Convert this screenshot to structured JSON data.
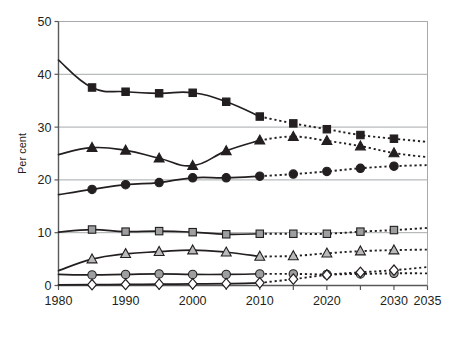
{
  "chart_data": {
    "type": "line",
    "title": "",
    "subtitle": "",
    "xlabel": "",
    "ylabel": "Per cent",
    "xlim": [
      1980,
      2035
    ],
    "ylim": [
      0,
      50
    ],
    "grid": true,
    "grid_axis": "y",
    "legend_position": "bottom",
    "x_tick_labels": [
      "1980",
      "1990",
      "2000",
      "2010",
      "2020",
      "2030",
      "2035"
    ],
    "x_tick_values": [
      1980,
      1990,
      2000,
      2010,
      2020,
      2030,
      2035
    ],
    "x_minor_tick_values": [
      1985,
      1995,
      2005,
      2015,
      2025
    ],
    "y_tick_labels": [
      "0",
      "10",
      "20",
      "30",
      "40",
      "50"
    ],
    "y_tick_values": [
      0,
      10,
      20,
      30,
      40,
      50
    ],
    "x": [
      1980,
      1985,
      1990,
      1995,
      2000,
      2005,
      2010,
      2015,
      2020,
      2025,
      2030,
      2035
    ],
    "historical_range": [
      1980,
      2010
    ],
    "projection_range": [
      2010,
      2035
    ],
    "projection_note": "Values from 2010 onward are shown with dashed lines (projection)",
    "series": [
      {
        "name": "Oil",
        "marker": "square",
        "marker_fill": "#231f20",
        "marker_edge": "#231f20",
        "line_color": "#231f20",
        "values": [
          42.7,
          37.5,
          36.7,
          36.4,
          36.5,
          34.8,
          32.0,
          30.7,
          29.6,
          28.5,
          27.8,
          27.2
        ]
      },
      {
        "name": "Coal",
        "marker": "triangle",
        "marker_fill": "#231f20",
        "marker_edge": "#231f20",
        "line_color": "#231f20",
        "values": [
          24.8,
          26.1,
          25.6,
          24.1,
          22.7,
          25.5,
          27.5,
          28.2,
          27.4,
          26.4,
          25.1,
          24.3
        ]
      },
      {
        "name": "Gas",
        "marker": "circle",
        "marker_fill": "#231f20",
        "marker_edge": "#231f20",
        "line_color": "#231f20",
        "values": [
          17.2,
          18.2,
          19.1,
          19.5,
          20.4,
          20.4,
          20.7,
          21.1,
          21.6,
          22.2,
          22.6,
          22.8
        ]
      },
      {
        "name": "Biomass and waste",
        "marker": "square",
        "marker_fill": "#9d9ea0",
        "marker_edge": "#231f20",
        "line_color": "#231f20",
        "values": [
          10.1,
          10.6,
          10.2,
          10.3,
          10.1,
          9.7,
          9.8,
          9.8,
          9.8,
          10.2,
          10.5,
          10.9
        ]
      },
      {
        "name": "Nuclear",
        "marker": "triangle",
        "marker_fill": "#b9babc",
        "marker_edge": "#231f20",
        "line_color": "#231f20",
        "values": [
          2.8,
          5.0,
          6.0,
          6.4,
          6.7,
          6.3,
          5.5,
          5.6,
          6.1,
          6.5,
          6.7,
          6.8
        ]
      },
      {
        "name": "Hydro",
        "marker": "circle",
        "marker_fill": "#9d9ea0",
        "marker_edge": "#231f20",
        "line_color": "#231f20",
        "values": [
          2.1,
          2.0,
          2.1,
          2.2,
          2.1,
          2.1,
          2.2,
          2.2,
          2.1,
          2.2,
          2.3,
          2.3
        ]
      },
      {
        "name": "Other renewables",
        "marker": "diamond",
        "marker_fill": "#ffffff",
        "marker_edge": "#231f20",
        "line_color": "#231f20",
        "values": [
          0.1,
          0.15,
          0.2,
          0.25,
          0.3,
          0.35,
          0.5,
          1.2,
          2.0,
          2.5,
          2.9,
          3.5
        ]
      }
    ]
  },
  "legend": {
    "rows": [
      [
        "Oil",
        "Coal",
        "Gas",
        "Biomass and waste"
      ],
      [
        "Nuclear",
        "Hydro",
        "Other renewables"
      ]
    ]
  }
}
